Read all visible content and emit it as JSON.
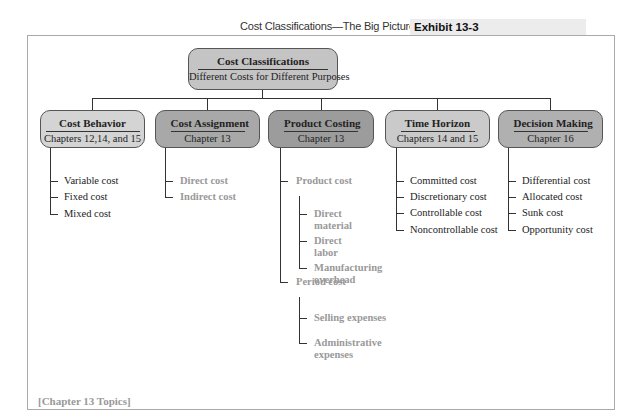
{
  "header": {
    "title": "Cost Classifications—The Big Picture",
    "exhibit": "Exhibit 13-3"
  },
  "colors": {
    "light_box": "#d4d4d4",
    "medium_box": "#b2b2b2",
    "dark_box": "#9c9c9c",
    "highlight_text": "#999999",
    "normal_text": "#222222"
  },
  "root": {
    "title": "Cost Classifications",
    "subtitle": "Different Costs for Different Purposes"
  },
  "categories": [
    {
      "title": "Cost Behavior",
      "subtitle": "Chapters 12,14, and 15",
      "items": [
        "Variable cost",
        "Fixed cost",
        "Mixed cost"
      ]
    },
    {
      "title": "Cost Assignment",
      "subtitle": "Chapter 13",
      "items": [
        "Direct cost",
        "Indirect cost"
      ]
    },
    {
      "title": "Product Costing",
      "subtitle": "Chapter 13",
      "groups": [
        {
          "label": "Product cost",
          "items": [
            "Direct material",
            "Direct labor",
            "Manufacturing overhead"
          ]
        },
        {
          "label": "Period cost",
          "items": [
            "Selling expenses",
            "Administrative expenses"
          ]
        }
      ]
    },
    {
      "title": "Time Horizon",
      "subtitle": "Chapters 14 and 15",
      "items": [
        "Committed cost",
        "Discretionary cost",
        "Controllable cost",
        "Noncontrollable cost"
      ]
    },
    {
      "title": "Decision Making",
      "subtitle": "Chapter 16",
      "items": [
        "Differential cost",
        "Allocated cost",
        "Sunk cost",
        "Opportunity cost"
      ]
    }
  ],
  "labels": {
    "direct_material_1": "Direct",
    "direct_material_2": "material",
    "direct_labor_1": "Direct",
    "direct_labor_2": "labor",
    "mfg_overhead_1": "Manufacturing",
    "mfg_overhead_2": "overhead",
    "admin_1": "Administrative",
    "admin_2": "expenses"
  },
  "footer": "[Chapter 13 Topics]"
}
